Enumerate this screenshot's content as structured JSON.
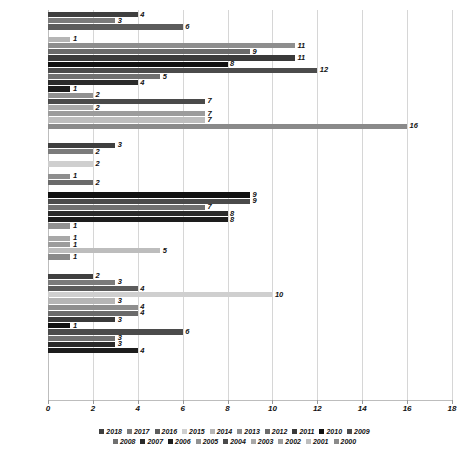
{
  "chart_data": {
    "type": "bar",
    "orientation": "horizontal",
    "title": "",
    "subtitle": "",
    "xlabel": "",
    "ylabel": "",
    "xlim": [
      0,
      18
    ],
    "xticks": [
      "0",
      "2",
      "4",
      "6",
      "8",
      "10",
      "12",
      "14",
      "16",
      "18"
    ],
    "grid": true,
    "legend_position": "bottom",
    "categories": [
      "CÓRDOBA",
      "CESAR",
      "BOLÍVAR"
    ],
    "series_order": [
      "2018",
      "2017",
      "2016",
      "2015",
      "2014",
      "2013",
      "2012",
      "2011",
      "2010",
      "2009",
      "2008",
      "2007",
      "2006",
      "2005",
      "2004",
      "2003",
      "2002",
      "2001",
      "2000"
    ],
    "groups": [
      {
        "category": "CÓRDOBA",
        "bars": [
          {
            "year": "2018",
            "value": 4,
            "label": "4"
          },
          {
            "year": "2017",
            "value": 3,
            "label": "3"
          },
          {
            "year": "2016",
            "value": 6,
            "label": "6"
          },
          {
            "year": "2015",
            "value": 0,
            "label": ""
          },
          {
            "year": "2014",
            "value": 1,
            "label": "1"
          },
          {
            "year": "2013",
            "value": 11,
            "label": "11"
          },
          {
            "year": "2012",
            "value": 9,
            "label": "9"
          },
          {
            "year": "2011",
            "value": 11,
            "label": "11"
          },
          {
            "year": "2010",
            "value": 8,
            "label": "8"
          },
          {
            "year": "2009",
            "value": 12,
            "label": "12"
          },
          {
            "year": "2008",
            "value": 5,
            "label": "5"
          },
          {
            "year": "2007",
            "value": 4,
            "label": "4"
          },
          {
            "year": "2006",
            "value": 1,
            "label": "1"
          },
          {
            "year": "2005",
            "value": 2,
            "label": "2"
          },
          {
            "year": "2004",
            "value": 7,
            "label": "7"
          },
          {
            "year": "2003",
            "value": 2,
            "label": "2"
          },
          {
            "year": "2002",
            "value": 7,
            "label": "7"
          },
          {
            "year": "2001",
            "value": 7,
            "label": "7"
          },
          {
            "year": "2000",
            "value": 16,
            "label": "16"
          }
        ]
      },
      {
        "category": "CESAR",
        "bars": [
          {
            "year": "2018",
            "value": 3,
            "label": "3"
          },
          {
            "year": "2017",
            "value": 2,
            "label": "2"
          },
          {
            "year": "2016",
            "value": 0,
            "label": ""
          },
          {
            "year": "2015",
            "value": 2,
            "label": "2"
          },
          {
            "year": "2014",
            "value": 0,
            "label": ""
          },
          {
            "year": "2013",
            "value": 1,
            "label": "1"
          },
          {
            "year": "2012",
            "value": 2,
            "label": "2"
          },
          {
            "year": "2011",
            "value": 0,
            "label": ""
          },
          {
            "year": "2010",
            "value": 9,
            "label": "9"
          },
          {
            "year": "2009",
            "value": 9,
            "label": "9"
          },
          {
            "year": "2008",
            "value": 7,
            "label": "7"
          },
          {
            "year": "2007",
            "value": 8,
            "label": "8"
          },
          {
            "year": "2006",
            "value": 8,
            "label": "8"
          },
          {
            "year": "2005",
            "value": 1,
            "label": "1"
          },
          {
            "year": "2004",
            "value": 0,
            "label": ""
          },
          {
            "year": "2003",
            "value": 1,
            "label": "1"
          },
          {
            "year": "2002",
            "value": 1,
            "label": "1"
          },
          {
            "year": "2001",
            "value": 5,
            "label": "5"
          },
          {
            "year": "2000",
            "value": 1,
            "label": "1"
          }
        ]
      },
      {
        "category": "BOLÍVAR",
        "bars": [
          {
            "year": "2018",
            "value": 2,
            "label": "2"
          },
          {
            "year": "2017",
            "value": 3,
            "label": "3"
          },
          {
            "year": "2016",
            "value": 4,
            "label": "4"
          },
          {
            "year": "2015",
            "value": 10,
            "label": "10"
          },
          {
            "year": "2014",
            "value": 3,
            "label": "3"
          },
          {
            "year": "2013",
            "value": 4,
            "label": "4"
          },
          {
            "year": "2012",
            "value": 4,
            "label": "4"
          },
          {
            "year": "2011",
            "value": 3,
            "label": "3"
          },
          {
            "year": "2010",
            "value": 1,
            "label": "1"
          },
          {
            "year": "2009",
            "value": 6,
            "label": "6"
          },
          {
            "year": "2008",
            "value": 3,
            "label": "3"
          },
          {
            "year": "2007",
            "value": 3,
            "label": "3"
          },
          {
            "year": "2006",
            "value": 4,
            "label": "4"
          },
          {
            "year": "2005",
            "value": 0,
            "label": ""
          },
          {
            "year": "2004",
            "value": 0,
            "label": ""
          },
          {
            "year": "2003",
            "value": 0,
            "label": ""
          },
          {
            "year": "2002",
            "value": 0,
            "label": ""
          },
          {
            "year": "2001",
            "value": 0,
            "label": ""
          },
          {
            "year": "2000",
            "value": 0,
            "label": ""
          }
        ]
      }
    ],
    "series_colors": {
      "2018": "#3f3f3f",
      "2017": "#7b7b7b",
      "2016": "#5c5c5c",
      "2015": "#cfcfcf",
      "2014": "#b5b5b5",
      "2013": "#8e8e8e",
      "2012": "#6a6a6a",
      "2011": "#3a3a3a",
      "2010": "#111111",
      "2009": "#4b4b4b",
      "2008": "#707070",
      "2007": "#2b2b2b",
      "2006": "#1d1d1d",
      "2005": "#919191",
      "2004": "#4a4a4a",
      "2003": "#a8a8a8",
      "2002": "#9c9c9c",
      "2001": "#bdbdbd",
      "2000": "#8a8a8a"
    }
  },
  "legend": {
    "row1": [
      "2018",
      "2017",
      "2016",
      "2015",
      "2014",
      "2013",
      "2012",
      "2011",
      "2010",
      "2009"
    ],
    "row2": [
      "2008",
      "2007",
      "2006",
      "2005",
      "2004",
      "2003",
      "2002",
      "2001",
      "2000"
    ]
  }
}
